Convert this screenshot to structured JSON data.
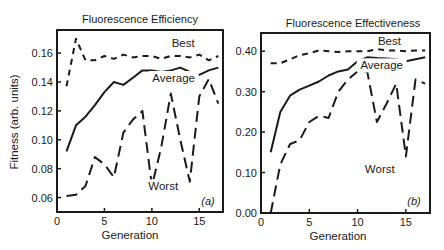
{
  "chart_data": [
    {
      "type": "line",
      "panel_label": "(a)",
      "title": "Fluorescence Efficiency",
      "xlabel": "Generation",
      "ylabel": "Fitness (arb. units)",
      "xlim": [
        0,
        17.5
      ],
      "ylim": [
        0.05,
        0.176
      ],
      "xticks": [
        0,
        5,
        10,
        15
      ],
      "xtick_labels": [
        "0",
        "5",
        "10",
        "15"
      ],
      "yticks": [
        0.06,
        0.08,
        0.1,
        0.12,
        0.14,
        0.16
      ],
      "ytick_labels": [
        "0.06",
        "0.08",
        "0.10",
        "0.12",
        "0.14",
        "0.16"
      ],
      "grid": false,
      "legend": "inline labels",
      "x": [
        1,
        2,
        3,
        4,
        5,
        6,
        7,
        8,
        9,
        10,
        11,
        12,
        13,
        14,
        15,
        16,
        17
      ],
      "series": [
        {
          "name": "Best",
          "style": "short-dash",
          "values": [
            0.137,
            0.17,
            0.155,
            0.155,
            0.158,
            0.156,
            0.159,
            0.157,
            0.158,
            0.158,
            0.156,
            0.158,
            0.158,
            0.157,
            0.159,
            0.155,
            0.158
          ]
        },
        {
          "name": "Average",
          "style": "solid",
          "values": [
            0.092,
            0.11,
            0.116,
            0.124,
            0.133,
            0.14,
            0.138,
            0.143,
            0.148,
            0.148,
            0.147,
            0.148,
            0.15,
            0.147,
            0.145,
            0.148,
            0.15
          ]
        },
        {
          "name": "Worst",
          "style": "long-dash",
          "values": [
            0.061,
            0.062,
            0.068,
            0.088,
            0.083,
            0.074,
            0.105,
            0.114,
            0.12,
            0.068,
            0.095,
            0.132,
            0.1,
            0.071,
            0.13,
            0.142,
            0.125
          ]
        }
      ],
      "series_label_positions": {
        "Best": [
          13.3,
          0.164
        ],
        "Average": [
          12.3,
          0.14
        ],
        "Worst": [
          11.2,
          0.065
        ]
      }
    },
    {
      "type": "line",
      "panel_label": "(b)",
      "title": "Fluorescence Effectiveness",
      "xlabel": "Generation",
      "ylabel": "",
      "xlim": [
        0,
        17.5
      ],
      "ylim": [
        0.0,
        0.445
      ],
      "xticks": [
        0,
        5,
        10,
        15
      ],
      "xtick_labels": [
        "0",
        "5",
        "10",
        "15"
      ],
      "yticks": [
        0.0,
        0.1,
        0.2,
        0.3,
        0.4
      ],
      "ytick_labels": [
        "0.00",
        "0.10",
        "0.20",
        "0.30",
        "0.40"
      ],
      "grid": false,
      "legend": "inline labels",
      "x": [
        1,
        2,
        3,
        4,
        5,
        6,
        7,
        8,
        9,
        10,
        11,
        12,
        13,
        14,
        15,
        16,
        17
      ],
      "series": [
        {
          "name": "Best",
          "style": "short-dash",
          "values": [
            0.37,
            0.37,
            0.38,
            0.39,
            0.395,
            0.402,
            0.4,
            0.398,
            0.4,
            0.4,
            0.4,
            0.405,
            0.402,
            0.402,
            0.4,
            0.402,
            0.402
          ]
        },
        {
          "name": "Average",
          "style": "solid",
          "values": [
            0.15,
            0.25,
            0.29,
            0.305,
            0.315,
            0.325,
            0.34,
            0.35,
            0.355,
            0.375,
            0.385,
            0.383,
            0.382,
            0.38,
            0.375,
            0.38,
            0.385
          ]
        },
        {
          "name": "Worst",
          "style": "long-dash",
          "values": [
            0.0,
            0.12,
            0.17,
            0.18,
            0.225,
            0.24,
            0.235,
            0.3,
            0.33,
            0.35,
            0.35,
            0.225,
            0.27,
            0.32,
            0.14,
            0.33,
            0.32
          ]
        }
      ],
      "series_label_positions": {
        "Best": [
          13.3,
          0.415
        ],
        "Average": [
          12.5,
          0.355
        ],
        "Worst": [
          12.3,
          0.1
        ]
      }
    }
  ],
  "figure": {
    "panels": [
      {
        "title": "Fluorescence Efficiency",
        "xlabel": "Generation",
        "ylabel": "Fitness (arb. units)",
        "panel_label": "(a)"
      },
      {
        "title": "Fluorescence Effectiveness",
        "xlabel": "Generation",
        "ylabel": "",
        "panel_label": "(b)"
      }
    ],
    "colors": {
      "ink": "#1a1a1a",
      "background": "#ffffff"
    }
  }
}
